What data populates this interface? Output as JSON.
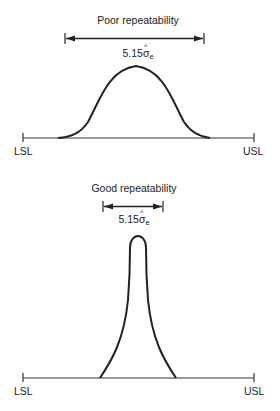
{
  "panels": [
    {
      "title": "Poor repeatability",
      "width_label": {
        "prefix": "5.15",
        "symbol": "σ",
        "subscript": "e"
      },
      "lower_limit": "LSL",
      "upper_limit": "USL",
      "curve": "wide bell-shaped distribution"
    },
    {
      "title": "Good repeatability",
      "width_label": {
        "prefix": "5.15",
        "symbol": "σ",
        "subscript": "e"
      },
      "lower_limit": "LSL",
      "upper_limit": "USL",
      "curve": "narrow peaked distribution"
    }
  ],
  "colors": {
    "line": "#222222",
    "background": "#ffffff"
  }
}
